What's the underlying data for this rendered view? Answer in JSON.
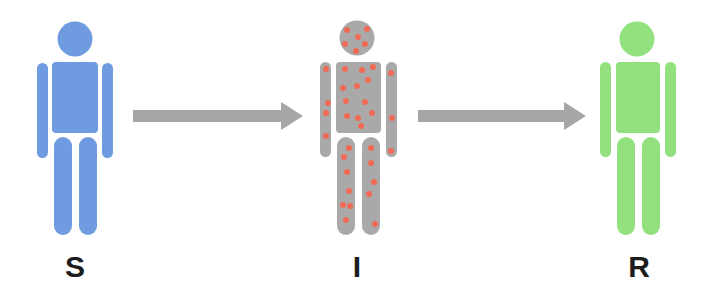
{
  "diagram": {
    "colors": {
      "susceptible": "#6f9be0",
      "infected_body": "#a9a9a9",
      "infected_spots": "#f06a55",
      "recovered": "#93e07f",
      "arrow": "#a6a6a6",
      "label_text": "#1c1c1c"
    },
    "nodes": [
      {
        "id": "S",
        "label": "S",
        "meaning": "susceptible person",
        "color": "blue"
      },
      {
        "id": "I",
        "label": "I",
        "meaning": "infected person",
        "color": "gray with red spots"
      },
      {
        "id": "R",
        "label": "R",
        "meaning": "recovered person",
        "color": "green"
      }
    ],
    "edges": [
      {
        "from": "S",
        "to": "I"
      },
      {
        "from": "I",
        "to": "R"
      }
    ]
  }
}
